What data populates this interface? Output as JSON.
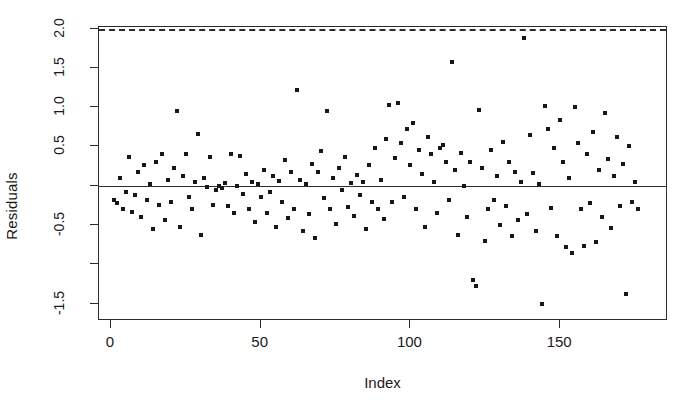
{
  "chart_data": {
    "type": "scatter",
    "title": "",
    "xlabel": "Index",
    "ylabel": "Residuals",
    "xlim": [
      -4,
      186
    ],
    "ylim": [
      -1.72,
      2.02
    ],
    "grid": false,
    "legend": null,
    "x_ticks": [
      {
        "value": 0,
        "label": "0"
      },
      {
        "value": 50,
        "label": "50"
      },
      {
        "value": 100,
        "label": "100"
      },
      {
        "value": 150,
        "label": "150"
      }
    ],
    "y_ticks": [
      {
        "value": 2.0,
        "label": "2.0"
      },
      {
        "value": 1.5,
        "label": "1.5"
      },
      {
        "value": 1.0,
        "label": "1.0"
      },
      {
        "value": 0.5,
        "label": "0.5"
      },
      {
        "value": 0.0,
        "label": ""
      },
      {
        "value": -0.5,
        "label": "-0.5"
      },
      {
        "value": -1.0,
        "label": ""
      },
      {
        "value": -1.5,
        "label": "-1.5"
      }
    ],
    "reference_lines": [
      {
        "y": 0.0,
        "style": "solid",
        "color": "#2b2b2b"
      },
      {
        "y": 2.0,
        "style": "dashed",
        "color": "#2b2b2b"
      }
    ],
    "marker": {
      "shape": "square",
      "size_px": 4,
      "color": "#171717"
    },
    "point_count": 176,
    "points": [
      [
        1,
        -0.18
      ],
      [
        2,
        -0.22
      ],
      [
        3,
        0.1
      ],
      [
        4,
        -0.3
      ],
      [
        5,
        -0.08
      ],
      [
        6,
        0.36
      ],
      [
        7,
        -0.33
      ],
      [
        8,
        -0.12
      ],
      [
        9,
        0.18
      ],
      [
        10,
        -0.4
      ],
      [
        11,
        0.26
      ],
      [
        12,
        -0.18
      ],
      [
        13,
        0.02
      ],
      [
        14,
        -0.55
      ],
      [
        15,
        0.3
      ],
      [
        16,
        -0.24
      ],
      [
        17,
        0.4
      ],
      [
        18,
        -0.44
      ],
      [
        19,
        0.07
      ],
      [
        20,
        -0.2
      ],
      [
        21,
        0.22
      ],
      [
        22,
        0.95
      ],
      [
        23,
        -0.52
      ],
      [
        24,
        0.12
      ],
      [
        25,
        0.41
      ],
      [
        26,
        -0.14
      ],
      [
        27,
        -0.3
      ],
      [
        28,
        0.05
      ],
      [
        29,
        0.66
      ],
      [
        30,
        -0.62
      ],
      [
        31,
        0.1
      ],
      [
        32,
        -0.02
      ],
      [
        33,
        0.36
      ],
      [
        34,
        -0.24
      ],
      [
        35,
        -0.05
      ],
      [
        36,
        0.0
      ],
      [
        37,
        -0.03
      ],
      [
        38,
        0.04
      ],
      [
        39,
        -0.26
      ],
      [
        40,
        0.4
      ],
      [
        41,
        -0.34
      ],
      [
        42,
        0.0
      ],
      [
        43,
        0.38
      ],
      [
        44,
        -0.11
      ],
      [
        45,
        0.15
      ],
      [
        46,
        -0.3
      ],
      [
        47,
        0.05
      ],
      [
        48,
        -0.46
      ],
      [
        49,
        0.02
      ],
      [
        50,
        -0.14
      ],
      [
        51,
        0.2
      ],
      [
        52,
        -0.35
      ],
      [
        53,
        -0.08
      ],
      [
        54,
        0.12
      ],
      [
        55,
        -0.52
      ],
      [
        56,
        0.06
      ],
      [
        57,
        -0.21
      ],
      [
        58,
        0.33
      ],
      [
        59,
        -0.41
      ],
      [
        60,
        0.17
      ],
      [
        61,
        -0.3
      ],
      [
        62,
        1.22
      ],
      [
        63,
        0.08
      ],
      [
        64,
        -0.58
      ],
      [
        65,
        0.02
      ],
      [
        66,
        -0.36
      ],
      [
        67,
        0.28
      ],
      [
        68,
        -0.66
      ],
      [
        69,
        0.18
      ],
      [
        70,
        0.44
      ],
      [
        71,
        -0.16
      ],
      [
        72,
        0.95
      ],
      [
        73,
        -0.3
      ],
      [
        74,
        0.1
      ],
      [
        75,
        -0.48
      ],
      [
        76,
        0.22
      ],
      [
        77,
        -0.05
      ],
      [
        78,
        0.36
      ],
      [
        79,
        -0.27
      ],
      [
        80,
        0.03
      ],
      [
        81,
        -0.38
      ],
      [
        82,
        0.14
      ],
      [
        83,
        -0.12
      ],
      [
        84,
        0.05
      ],
      [
        85,
        -0.55
      ],
      [
        86,
        0.26
      ],
      [
        87,
        -0.2
      ],
      [
        88,
        0.48
      ],
      [
        89,
        -0.3
      ],
      [
        90,
        0.08
      ],
      [
        91,
        -0.42
      ],
      [
        92,
        0.6
      ],
      [
        93,
        1.03
      ],
      [
        94,
        -0.2
      ],
      [
        95,
        0.35
      ],
      [
        96,
        1.05
      ],
      [
        97,
        0.55
      ],
      [
        98,
        -0.14
      ],
      [
        99,
        0.72
      ],
      [
        100,
        0.26
      ],
      [
        101,
        0.8
      ],
      [
        102,
        -0.3
      ],
      [
        103,
        0.45
      ],
      [
        104,
        0.15
      ],
      [
        105,
        -0.52
      ],
      [
        106,
        0.62
      ],
      [
        107,
        0.4
      ],
      [
        108,
        0.05
      ],
      [
        109,
        -0.35
      ],
      [
        110,
        0.48
      ],
      [
        111,
        0.52
      ],
      [
        112,
        0.3
      ],
      [
        113,
        -0.18
      ],
      [
        114,
        1.58
      ],
      [
        115,
        0.2
      ],
      [
        116,
        -0.62
      ],
      [
        117,
        0.42
      ],
      [
        118,
        0.0
      ],
      [
        119,
        -0.4
      ],
      [
        120,
        0.3
      ],
      [
        121,
        -1.2
      ],
      [
        122,
        -1.28
      ],
      [
        123,
        0.96
      ],
      [
        124,
        0.22
      ],
      [
        125,
        -0.7
      ],
      [
        126,
        -0.3
      ],
      [
        127,
        0.46
      ],
      [
        128,
        -0.18
      ],
      [
        129,
        0.12
      ],
      [
        130,
        -0.5
      ],
      [
        131,
        0.56
      ],
      [
        132,
        -0.26
      ],
      [
        133,
        0.3
      ],
      [
        134,
        -0.64
      ],
      [
        135,
        0.18
      ],
      [
        136,
        -0.44
      ],
      [
        137,
        0.05
      ],
      [
        138,
        1.88
      ],
      [
        139,
        -0.36
      ],
      [
        140,
        0.64
      ],
      [
        141,
        0.16
      ],
      [
        142,
        -0.58
      ],
      [
        143,
        0.02
      ],
      [
        144,
        -1.5
      ],
      [
        145,
        1.02
      ],
      [
        146,
        0.72
      ],
      [
        147,
        -0.28
      ],
      [
        148,
        0.48
      ],
      [
        149,
        -0.64
      ],
      [
        150,
        0.84
      ],
      [
        151,
        0.3
      ],
      [
        152,
        -0.78
      ],
      [
        153,
        0.1
      ],
      [
        154,
        -0.86
      ],
      [
        155,
        1.0
      ],
      [
        156,
        0.55
      ],
      [
        157,
        -0.3
      ],
      [
        158,
        -0.76
      ],
      [
        159,
        0.4
      ],
      [
        160,
        -0.22
      ],
      [
        161,
        0.68
      ],
      [
        162,
        -0.72
      ],
      [
        163,
        0.2
      ],
      [
        164,
        -0.4
      ],
      [
        165,
        0.92
      ],
      [
        166,
        0.34
      ],
      [
        167,
        -0.54
      ],
      [
        168,
        0.12
      ],
      [
        169,
        0.62
      ],
      [
        170,
        -0.26
      ],
      [
        171,
        0.28
      ],
      [
        172,
        -1.38
      ],
      [
        173,
        0.5
      ],
      [
        174,
        -0.2
      ],
      [
        175,
        0.05
      ],
      [
        176,
        -0.3
      ]
    ]
  }
}
